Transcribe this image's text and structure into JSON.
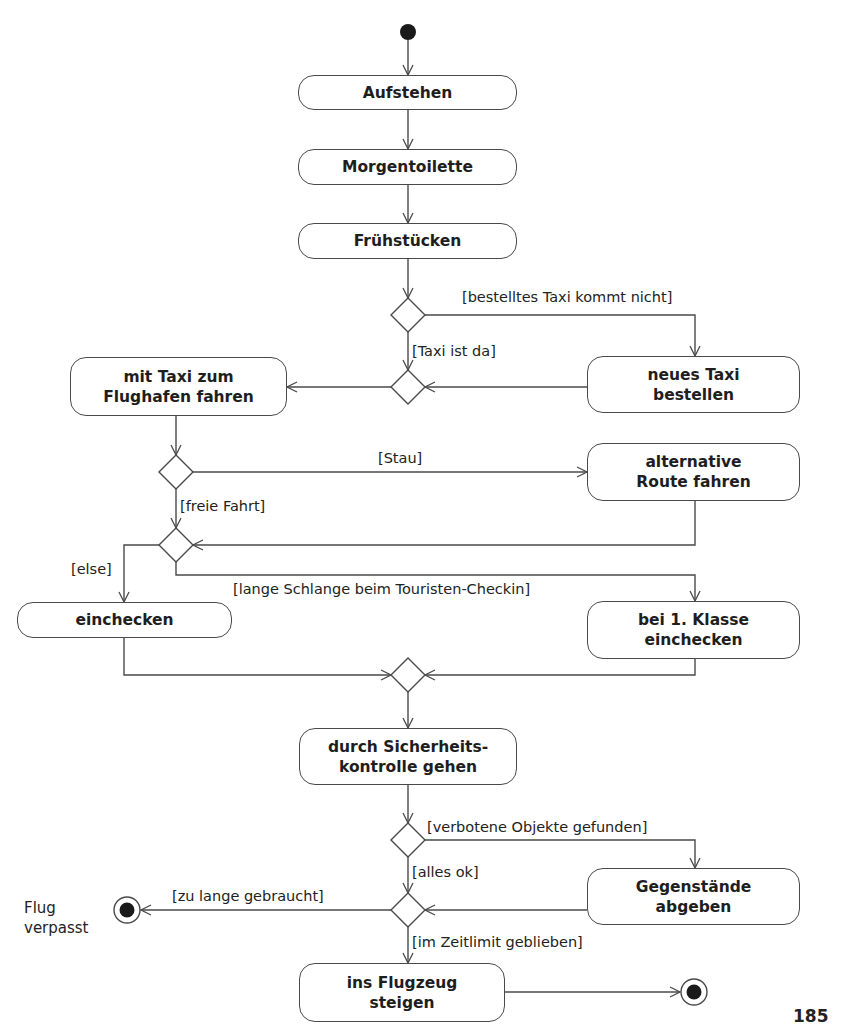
{
  "diagram": {
    "type": "UML activity diagram",
    "actions": {
      "aufstehen": "Aufstehen",
      "morgentoilette": "Morgentoilette",
      "fruehstuecken": "Frühstücken",
      "taxi_fahren": "mit Taxi zum\nFlughafen fahren",
      "neues_taxi": "neues Taxi\nbestellen",
      "alternative_route": "alternative\nRoute fahren",
      "einchecken": "einchecken",
      "erste_klasse": "bei 1. Klasse\neinchecken",
      "sicherheitskontrolle": "durch Sicherheits-\nkontrolle gehen",
      "gegenstaende": "Gegenstände\nabgeben",
      "einsteigen": "ins Flugzeug\nsteigen"
    },
    "guards": {
      "taxi_kommt_nicht": "[bestelltes Taxi kommt nicht]",
      "taxi_da": "[Taxi ist da]",
      "stau": "[Stau]",
      "freie_fahrt": "[freie Fahrt]",
      "else": "[else]",
      "lange_schlange": "[lange Schlange beim Touristen-Checkin]",
      "verbotene_objekte": "[verbotene Objekte gefunden]",
      "alles_ok": "[alles ok]",
      "zu_lange": "[zu lange gebraucht]",
      "im_zeitlimit": "[im Zeitlimit geblieben]"
    },
    "final_labels": {
      "flug_verpasst": "Flug\nverpasst"
    },
    "colors": {
      "stroke": "#4a4a4a",
      "fill": "#ffffff",
      "node_fill": "#1a1a1a"
    }
  },
  "page": {
    "number": "185"
  }
}
